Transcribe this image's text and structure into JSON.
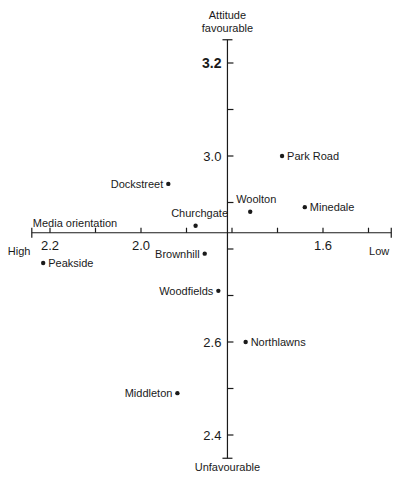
{
  "chart_data": {
    "type": "scatter",
    "title": "",
    "xlabel": "Media orientation",
    "ylabel": "Attitude favourable",
    "x_axis": {
      "label": "Media orientation",
      "left_end_label": "High",
      "right_end_label": "Low",
      "reversed": true,
      "range": [
        2.24,
        1.45
      ],
      "ticks": [
        2.2,
        2.1,
        2.0,
        1.9,
        1.8,
        1.7,
        1.6,
        1.5
      ],
      "tick_labels": [
        "2.2",
        "2.0",
        "1.6"
      ],
      "crosses_y_at": 2.835
    },
    "y_axis": {
      "top_label_line1": "Attitude",
      "top_label_line2": "favourable",
      "bottom_label": "Unfavourable",
      "range": [
        2.35,
        3.25
      ],
      "ticks": [
        3.2,
        3.1,
        3.0,
        2.9,
        2.8,
        2.7,
        2.6,
        2.5,
        2.4
      ],
      "tick_labels": [
        "3.2",
        "3.0",
        "2.6",
        "2.4"
      ],
      "crosses_x_at": 1.81
    },
    "grid": false,
    "legend": null,
    "points": [
      {
        "name": "Park Road",
        "x": 1.69,
        "y": 3.0,
        "label_side": "right"
      },
      {
        "name": "Dockstreet",
        "x": 1.94,
        "y": 2.94,
        "label_side": "left"
      },
      {
        "name": "Woolton",
        "x": 1.76,
        "y": 2.88,
        "label_side": "above"
      },
      {
        "name": "Minedale",
        "x": 1.64,
        "y": 2.89,
        "label_side": "right"
      },
      {
        "name": "Churchgate",
        "x": 1.88,
        "y": 2.85,
        "label_side": "above-left"
      },
      {
        "name": "Brownhill",
        "x": 1.86,
        "y": 2.79,
        "label_side": "left"
      },
      {
        "name": "Peakside",
        "x": 2.215,
        "y": 2.77,
        "label_side": "right"
      },
      {
        "name": "Woodfields",
        "x": 1.83,
        "y": 2.71,
        "label_side": "left"
      },
      {
        "name": "Northlawns",
        "x": 1.77,
        "y": 2.6,
        "label_side": "right"
      },
      {
        "name": "Middleton",
        "x": 1.92,
        "y": 2.49,
        "label_side": "left"
      }
    ]
  }
}
